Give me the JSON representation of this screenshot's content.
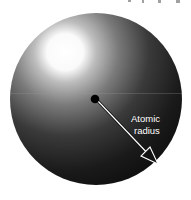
{
  "diagram": {
    "subject": "atom",
    "label": {
      "line1": "Atomic",
      "line2": "radius"
    },
    "colors": {
      "highlight": "#ffffff",
      "midtone": "#7a7a7a",
      "shadow": "#141414",
      "nucleus": "#000000",
      "arrow_fill": "#ffffff",
      "arrow_outline": "#111111",
      "background": "#ffffff"
    },
    "icons": {
      "nucleus": "nucleus-dot-icon",
      "radius_arrow": "arrow-icon"
    }
  }
}
